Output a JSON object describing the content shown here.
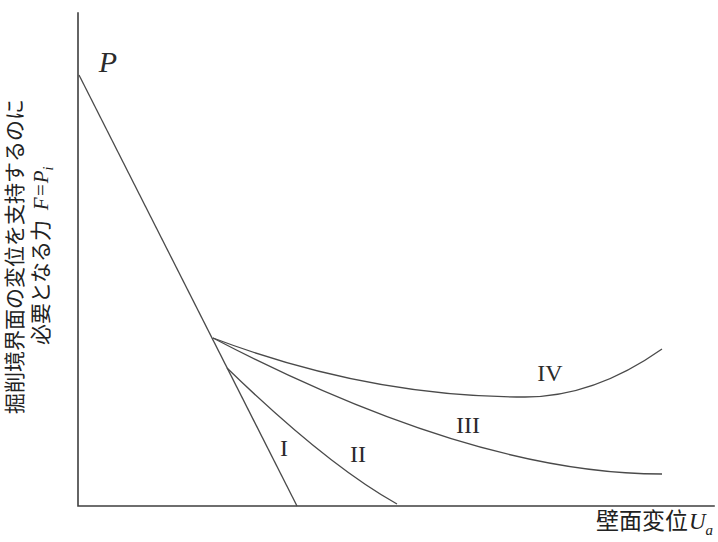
{
  "chart_data": {
    "type": "line",
    "title": "",
    "units": "pixels",
    "xlabel": {
      "text": "壁面変位",
      "var": "U",
      "sub": "a"
    },
    "ylabel": {
      "line1": "掘削境界面の変位を支持するのに",
      "line2_prefix": "必要となる力",
      "line2_var": "F=P",
      "line2_sub": "i"
    },
    "axes": {
      "origin_x": 78,
      "origin_y": 506,
      "x_end": 714,
      "y_top": 13,
      "grid": false,
      "ticks": "none"
    },
    "legend_position": "none",
    "series": [
      {
        "name": "curve-I-main-line-from-P",
        "label": "I",
        "path": {
          "type": "line",
          "points": [
            [
              79,
              75
            ],
            [
              297,
              506
            ]
          ]
        }
      },
      {
        "name": "curve-II",
        "label": "II",
        "path": {
          "type": "quad",
          "points": [
            [
              227,
              368
            ],
            [
              327,
              465
            ],
            [
              397,
              504
            ]
          ]
        }
      },
      {
        "name": "curve-III",
        "label": "III",
        "path": {
          "type": "cubic",
          "points": [
            [
              213,
              338
            ],
            [
              380,
              425
            ],
            [
              530,
              474
            ],
            [
              662,
              474
            ]
          ]
        }
      },
      {
        "name": "curve-IV",
        "label": "IV",
        "path": {
          "type": "quad2",
          "points": [
            [
              213,
              338
            ],
            [
              369,
              397
            ],
            [
              525,
              397
            ],
            [
              594,
              397
            ],
            [
              662,
              349
            ]
          ]
        }
      }
    ],
    "annotations": [
      {
        "name": "point-p-label",
        "text": "P",
        "x": 108,
        "y": 62,
        "cls": "p-label"
      },
      {
        "name": "curve-label-i",
        "text": "I",
        "x": 284,
        "y": 448,
        "cls": "curve-label"
      },
      {
        "name": "curve-label-ii",
        "text": "II",
        "x": 358,
        "y": 454,
        "cls": "curve-label"
      },
      {
        "name": "curve-label-iii",
        "text": "III",
        "x": 468,
        "y": 425,
        "cls": "curve-label"
      },
      {
        "name": "curve-label-iv",
        "text": "IV",
        "x": 550,
        "y": 373,
        "cls": "curve-label"
      }
    ],
    "colors": {
      "curve": "#4a4a4a",
      "axis": "#3f3f3f",
      "text": "#222222",
      "background": "#ffffff"
    }
  }
}
